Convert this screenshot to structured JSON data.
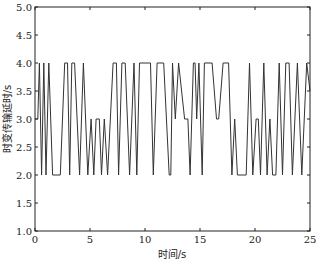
{
  "chart_data": {
    "type": "line",
    "title": "",
    "xlabel": "时间/s",
    "ylabel": "时变传输延时/s",
    "xlim": [
      0,
      25
    ],
    "ylim": [
      1.0,
      5.0
    ],
    "xticks": [
      0,
      5,
      10,
      15,
      20,
      25
    ],
    "xtick_labels": [
      "0",
      "5",
      "10",
      "15",
      "20",
      "25"
    ],
    "yticks": [
      1.0,
      1.5,
      2.0,
      2.5,
      3.0,
      3.5,
      4.0,
      4.5,
      5.0
    ],
    "ytick_labels": [
      "1.0",
      "1.5",
      "2.0",
      "2.5",
      "3.0",
      "3.5",
      "4.0",
      "4.5",
      "5.0"
    ],
    "grid": false,
    "legend": null,
    "series": [
      {
        "name": "time-varying delay",
        "color": "#333333",
        "x": [
          0,
          0.25,
          0.4,
          0.6,
          0.8,
          1.0,
          1.25,
          1.6,
          2.3,
          2.7,
          2.95,
          3.15,
          3.35,
          3.6,
          4.05,
          4.4,
          4.8,
          5.1,
          5.35,
          5.55,
          5.85,
          6.05,
          6.3,
          6.6,
          7.1,
          7.4,
          7.6,
          7.9,
          8.2,
          8.6,
          9.0,
          9.25,
          9.5,
          10.5,
          10.75,
          11.1,
          11.7,
          12.2,
          12.35,
          12.5,
          12.75,
          13.05,
          13.6,
          13.9,
          14.1,
          14.4,
          14.55,
          14.7,
          14.9,
          15.2,
          15.4,
          16.1,
          16.5,
          16.7,
          17.1,
          17.6,
          17.9,
          18.15,
          18.4,
          19.2,
          19.5,
          19.8,
          20.1,
          20.3,
          20.5,
          20.8,
          21.1,
          21.35,
          21.6,
          21.9,
          22.2,
          22.5,
          22.8,
          23.1,
          23.4,
          23.85,
          24.25,
          24.7,
          25
        ],
        "y": [
          3,
          3,
          4,
          2,
          4,
          2,
          4,
          2,
          2,
          4,
          4,
          2,
          4,
          4,
          2,
          4,
          2,
          3,
          2,
          3,
          3,
          2,
          3,
          2,
          4,
          4,
          2,
          4,
          4,
          2,
          4,
          2,
          4,
          4,
          2,
          4,
          4,
          2,
          2,
          4,
          3,
          4,
          3,
          3,
          2,
          4,
          4,
          3,
          4,
          2,
          4,
          4,
          3,
          3,
          4,
          4,
          2,
          3,
          2,
          2,
          4,
          2,
          3,
          3,
          2,
          4,
          2,
          3,
          2,
          2,
          4,
          2,
          4,
          4,
          2,
          4,
          2,
          4,
          3.5
        ]
      }
    ]
  }
}
